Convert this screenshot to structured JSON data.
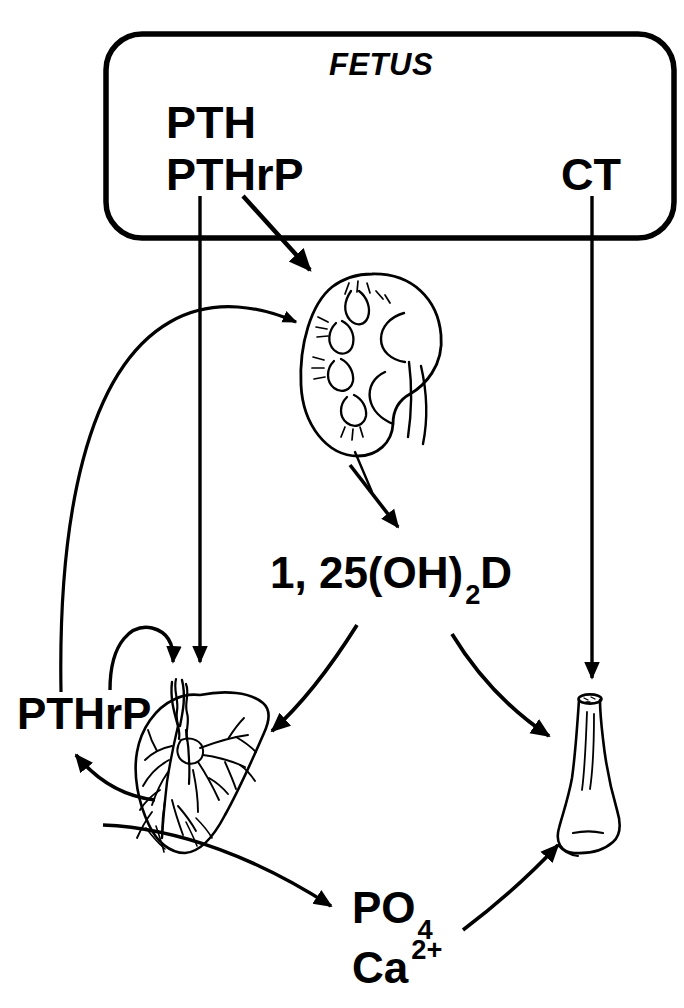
{
  "figure": {
    "type": "biomedical-flow-diagram"
  },
  "fetus_box": {
    "title": "FETUS",
    "hormones": {
      "pth": "PTH",
      "pthrp": "PTHrP",
      "ct": "CT"
    }
  },
  "nodes": {
    "kidney": {
      "icon": "kidney-organ-icon",
      "label": ""
    },
    "placenta": {
      "icon": "placenta-organ-icon",
      "label": ""
    },
    "bone": {
      "icon": "long-bone-icon",
      "label": ""
    },
    "vitamin_d": {
      "text_main": "1, 25(OH)",
      "subscript": "2",
      "text_tail": "D",
      "full": "1, 25(OH)2D"
    },
    "pthrp_placental": {
      "label": "PTHrP"
    },
    "phosphate": {
      "text_main": "PO",
      "subscript": "4",
      "full": "PO4"
    },
    "calcium": {
      "text_main": "Ca",
      "superscript": "2+",
      "full": "Ca2+"
    }
  },
  "edges": [
    {
      "name": "pth-to-placenta",
      "from": "PTH",
      "to": "placenta",
      "style": "straight-vertical"
    },
    {
      "name": "pthrp-to-kidney",
      "from": "PTHrP",
      "to": "kidney",
      "style": "straight-diagonal"
    },
    {
      "name": "ct-to-bone",
      "from": "CT",
      "to": "bone",
      "style": "straight-vertical"
    },
    {
      "name": "kidney-to-vitamind",
      "from": "kidney",
      "to": "vitamin_d",
      "style": "straight-diagonal"
    },
    {
      "name": "vitamind-to-placenta",
      "from": "vitamin_d",
      "to": "placenta",
      "style": "curved"
    },
    {
      "name": "vitamind-to-bone",
      "from": "vitamin_d",
      "to": "bone",
      "style": "curved"
    },
    {
      "name": "placental-pthrp-to-kidney",
      "from": "pthrp_placental",
      "to": "kidney",
      "style": "long-curve"
    },
    {
      "name": "placental-pthrp-to-placenta",
      "from": "pthrp_placental",
      "to": "placenta",
      "style": "short-arc"
    },
    {
      "name": "placenta-to-pthrp",
      "from": "placenta",
      "to": "pthrp_placental",
      "style": "curved"
    },
    {
      "name": "placenta-to-minerals",
      "from": "placenta",
      "to": "phosphate",
      "style": "long-curve"
    },
    {
      "name": "minerals-to-bone",
      "from": "phosphate",
      "to": "bone",
      "style": "curved"
    }
  ],
  "colors": {
    "stroke": "#000000",
    "background": "#ffffff",
    "text": "#000000"
  }
}
